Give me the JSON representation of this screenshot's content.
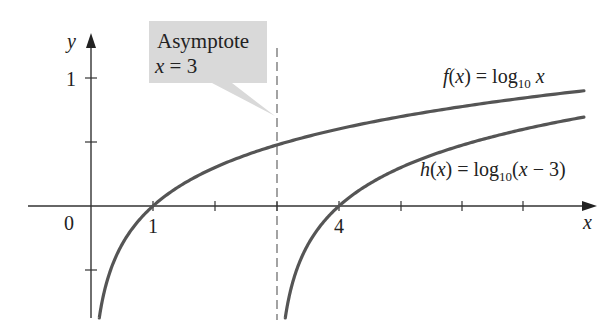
{
  "chart_data": {
    "type": "line",
    "title": "",
    "xlabel": "x",
    "ylabel": "y",
    "origin_label": "0",
    "x_ticks": [
      1,
      2,
      3,
      4,
      5,
      6,
      7
    ],
    "x_tick_labels": {
      "1": "1",
      "4": "4"
    },
    "y_ticks": [
      -0.5,
      0.5,
      1
    ],
    "y_tick_labels": {
      "1": "1"
    },
    "xlim": [
      -1,
      8.2
    ],
    "ylim": [
      -0.9,
      1.35
    ],
    "grid": false,
    "series": [
      {
        "name": "f(x) = log10 x",
        "function": "log10(x)",
        "x": [
          0.05,
          0.1,
          0.25,
          0.5,
          1,
          2,
          3,
          4,
          5,
          6,
          7,
          7.95
        ],
        "values": [
          -1.3,
          -1.0,
          -0.6,
          -0.3,
          0,
          0.301,
          0.477,
          0.602,
          0.699,
          0.778,
          0.845,
          0.9
        ],
        "color": "#555555"
      },
      {
        "name": "h(x) = log10(x − 3)",
        "function": "log10(x - 3)",
        "x": [
          3.05,
          3.1,
          3.25,
          3.5,
          4,
          5,
          6,
          7,
          7.95
        ],
        "values": [
          -1.3,
          -1.0,
          -0.6,
          -0.3,
          0,
          0.301,
          0.477,
          0.602,
          0.695
        ],
        "color": "#555555"
      }
    ],
    "annotations": [
      {
        "type": "vertical-asymptote",
        "x": 3,
        "style": "dashed",
        "label": "Asymptote x = 3"
      }
    ]
  },
  "labels": {
    "y_axis": "y",
    "x_axis": "x",
    "origin": "0",
    "tick_1x": "1",
    "tick_4x": "4",
    "tick_1y": "1",
    "callout_line1": "Asymptote",
    "callout_line2_var": "x",
    "callout_line2_rest": " = 3",
    "f_label": {
      "fn": "f",
      "paren_open": "(",
      "var": "x",
      "paren_close": ")",
      "eq": " = log",
      "sub": "10",
      "arg": " x"
    },
    "h_label": {
      "fn": "h",
      "paren_open": "(",
      "var": "x",
      "paren_close": ")",
      "eq": " = log",
      "sub": "10",
      "arg_open": "(",
      "arg_var": "x",
      "arg_rest": " − 3)"
    }
  },
  "colors": {
    "curve": "#555555",
    "axis": "#333333",
    "callout_bg": "#d9d9d9",
    "asymptote": "#666666"
  }
}
